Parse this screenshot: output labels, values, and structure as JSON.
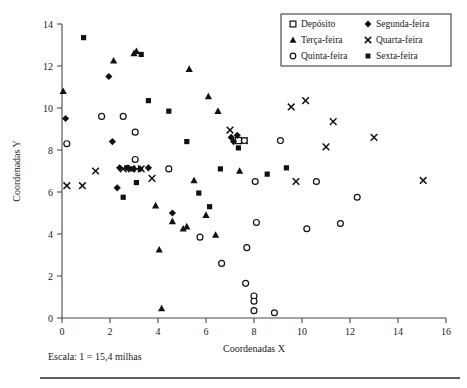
{
  "chart_data": {
    "type": "scatter",
    "title": "",
    "xlabel": "Coordenadas X",
    "ylabel": "Coordenadas Y",
    "xlim": [
      0,
      16
    ],
    "ylim": [
      0,
      14
    ],
    "xticks": [
      0,
      2,
      4,
      6,
      8,
      10,
      12,
      14,
      16
    ],
    "yticks": [
      0,
      2,
      4,
      6,
      8,
      10,
      12,
      14
    ],
    "grid": false,
    "legend_position": "top-right",
    "caption": "Escala: 1 = 15,4 milhas",
    "series": [
      {
        "name": "Depósito",
        "marker": "open-square",
        "points": [
          [
            7.35,
            8.45
          ]
        ]
      },
      {
        "name": "Segunda-feira",
        "marker": "filled-diamond",
        "points": [
          [
            0.15,
            9.5
          ],
          [
            1.95,
            11.5
          ],
          [
            2.1,
            8.4
          ],
          [
            2.4,
            7.15
          ],
          [
            2.75,
            7.15
          ],
          [
            3.0,
            7.1
          ],
          [
            3.25,
            7.1
          ],
          [
            3.6,
            7.15
          ],
          [
            2.3,
            6.2
          ],
          [
            4.6,
            5.0
          ],
          [
            7.05,
            8.6
          ],
          [
            7.15,
            8.4
          ],
          [
            7.3,
            8.7
          ]
        ]
      },
      {
        "name": "Terça-feira",
        "marker": "filled-triangle",
        "points": [
          [
            0.05,
            10.8
          ],
          [
            2.15,
            12.25
          ],
          [
            3.0,
            12.6
          ],
          [
            3.1,
            12.7
          ],
          [
            5.3,
            11.85
          ],
          [
            6.1,
            10.55
          ],
          [
            6.5,
            9.85
          ],
          [
            7.4,
            7.0
          ],
          [
            3.9,
            5.35
          ],
          [
            4.6,
            4.6
          ],
          [
            5.05,
            4.25
          ],
          [
            5.2,
            4.35
          ],
          [
            6.0,
            4.9
          ],
          [
            6.4,
            3.95
          ],
          [
            4.05,
            3.25
          ],
          [
            4.15,
            0.45
          ],
          [
            5.5,
            6.55
          ]
        ]
      },
      {
        "name": "Quarta-feira",
        "marker": "x",
        "points": [
          [
            0.2,
            6.3
          ],
          [
            1.4,
            7.0
          ],
          [
            2.55,
            7.1
          ],
          [
            2.9,
            7.1
          ],
          [
            3.3,
            7.1
          ],
          [
            0.85,
            6.3
          ],
          [
            3.75,
            6.65
          ],
          [
            7.0,
            8.95
          ],
          [
            7.6,
            8.45
          ],
          [
            9.55,
            10.05
          ],
          [
            10.15,
            10.35
          ],
          [
            11.3,
            9.35
          ],
          [
            11.0,
            8.15
          ],
          [
            13.0,
            8.6
          ],
          [
            15.05,
            6.55
          ],
          [
            9.75,
            6.5
          ]
        ]
      },
      {
        "name": "Quinta-feira",
        "marker": "open-circle",
        "points": [
          [
            0.2,
            8.3
          ],
          [
            1.65,
            9.6
          ],
          [
            2.55,
            9.6
          ],
          [
            3.05,
            8.85
          ],
          [
            3.05,
            7.55
          ],
          [
            4.45,
            7.1
          ],
          [
            7.6,
            8.45
          ],
          [
            9.1,
            8.45
          ],
          [
            8.05,
            6.5
          ],
          [
            10.6,
            6.5
          ],
          [
            12.3,
            5.75
          ],
          [
            8.1,
            4.55
          ],
          [
            10.2,
            4.25
          ],
          [
            11.6,
            4.5
          ],
          [
            7.7,
            3.35
          ],
          [
            6.65,
            2.6
          ],
          [
            7.65,
            1.65
          ],
          [
            8.0,
            1.05
          ],
          [
            8.0,
            0.8
          ],
          [
            8.0,
            0.35
          ],
          [
            8.85,
            0.25
          ],
          [
            5.75,
            3.85
          ]
        ]
      },
      {
        "name": "Sexta-feira",
        "marker": "filled-square",
        "points": [
          [
            0.9,
            13.35
          ],
          [
            3.3,
            12.55
          ],
          [
            3.6,
            10.35
          ],
          [
            4.45,
            9.85
          ],
          [
            2.7,
            7.15
          ],
          [
            2.95,
            7.1
          ],
          [
            5.2,
            8.4
          ],
          [
            6.6,
            7.1
          ],
          [
            8.55,
            6.85
          ],
          [
            9.35,
            7.15
          ],
          [
            3.1,
            6.45
          ],
          [
            2.55,
            5.75
          ],
          [
            5.7,
            5.95
          ],
          [
            7.35,
            8.1
          ],
          [
            6.15,
            5.3
          ]
        ]
      }
    ]
  },
  "legend": {
    "entries": [
      {
        "label": "Depósito",
        "marker": "open-square"
      },
      {
        "label": "Segunda-feira",
        "marker": "filled-diamond"
      },
      {
        "label": "Terça-feira",
        "marker": "filled-triangle"
      },
      {
        "label": "Quarta-feira",
        "marker": "x"
      },
      {
        "label": "Quinta-feira",
        "marker": "open-circle"
      },
      {
        "label": "Sexta-feira",
        "marker": "filled-square"
      }
    ]
  },
  "caption": {
    "text": "Escala: 1 = 15,4 milhas"
  },
  "axes": {
    "x_title": "Coordenadas X",
    "y_title": "Coordenadas Y"
  },
  "colors": {
    "marker": "#111111",
    "axis": "#4a4a4a",
    "text": "#1a1a1a",
    "background": "#ffffff"
  }
}
